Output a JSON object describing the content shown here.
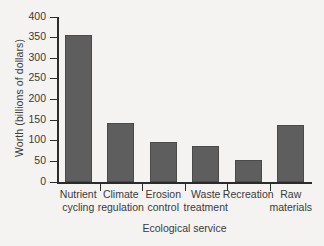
{
  "chart_data": {
    "type": "bar",
    "title": "",
    "xlabel": "Ecological service",
    "ylabel": "Worth (billions of dollars)",
    "categories": [
      "Nutrient cycling",
      "Climate regulation",
      "Erosion control",
      "Waste treatment",
      "Recreation",
      "Raw materials"
    ],
    "category_lines": [
      [
        "Nutrient",
        "cycling"
      ],
      [
        "Climate",
        "regulation"
      ],
      [
        "Erosion",
        "control"
      ],
      [
        "Waste",
        "treatment"
      ],
      [
        "Recreation",
        ""
      ],
      [
        "Raw",
        "materials"
      ]
    ],
    "values": [
      356,
      142,
      97,
      88,
      54,
      138
    ],
    "ylim": [
      0,
      400
    ],
    "ytick_labels": [
      "0",
      "50",
      "100",
      "150",
      "200",
      "250",
      "300",
      "350",
      "400"
    ],
    "ytick_values": [
      0,
      50,
      100,
      150,
      200,
      250,
      300,
      350,
      400
    ],
    "grid": false,
    "legend": "none",
    "bar_color": "#5e5e5e",
    "axis_color": "#2b2b2b",
    "background_color": "#f4f3f1",
    "text_color": "#3a3a3a"
  }
}
